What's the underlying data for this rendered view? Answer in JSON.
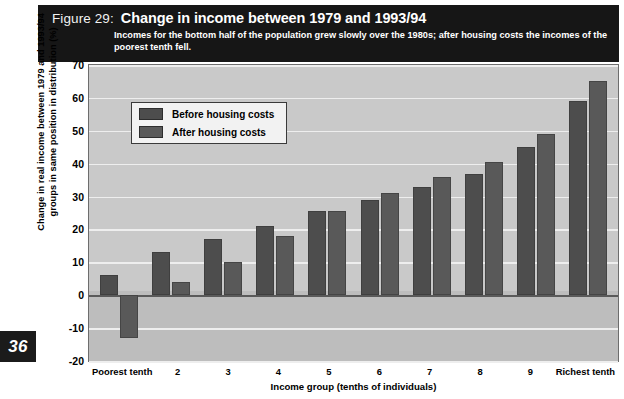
{
  "header": {
    "figure_label": "Figure 29:",
    "title": "Change in income between 1979 and 1993/94",
    "subtitle": "Incomes for the bottom half of the population grew slowly over the 1980s; after housing costs the incomes of the poorest tenth fell."
  },
  "page_number": "36",
  "legend": {
    "items": [
      {
        "label": "Before housing costs",
        "color": "#4d4d4d"
      },
      {
        "label": "After housing costs",
        "color": "#595959"
      }
    ]
  },
  "colors": {
    "header_band": "#161616",
    "plot_background": "#c3c3c3",
    "gridline": "#eeeeee",
    "zero_line": "#5a5a5a",
    "before_bar": "#4d4d4d",
    "after_bar": "#595959"
  },
  "chart_data": {
    "type": "bar",
    "title": "Change in income between 1979 and 1993/94",
    "subtitle": "Incomes for the bottom half of the population grew slowly over the 1980s; after housing costs the incomes of the poorest tenth fell.",
    "xlabel": "Income group (tenths of individuals)",
    "ylabel": "Change in real income between 1979 and 1993/94 groups in same position in distribution (%)",
    "categories": [
      "Poorest tenth",
      "2",
      "3",
      "4",
      "5",
      "6",
      "7",
      "8",
      "9",
      "Richest tenth"
    ],
    "series": [
      {
        "name": "Before housing costs",
        "values": [
          6,
          13,
          17,
          21,
          25.5,
          29,
          33,
          37,
          45,
          59
        ]
      },
      {
        "name": "After housing costs",
        "values": [
          -13,
          4,
          10,
          18,
          25.5,
          31,
          36,
          40.5,
          49,
          65
        ]
      }
    ],
    "ylim": [
      -20,
      70
    ],
    "yticks": [
      70,
      60,
      50,
      40,
      30,
      20,
      10,
      0,
      -10,
      -20
    ],
    "ytick_labels": [
      "70",
      "60",
      "50",
      "40",
      "30",
      "20",
      "10",
      "0",
      "-10",
      "-20"
    ],
    "grid": true,
    "legend_position": "upper left"
  }
}
